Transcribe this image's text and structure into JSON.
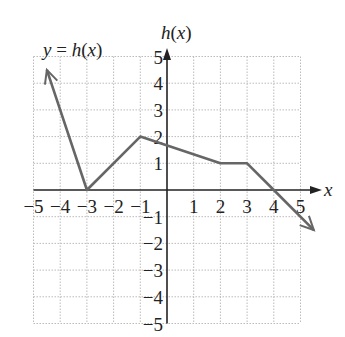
{
  "chart_data": {
    "type": "line",
    "title": "y = h(x)",
    "xlabel": "x",
    "ylabel": "h(x)",
    "xlim": [
      -5,
      5
    ],
    "ylim": [
      -5,
      5
    ],
    "grid": true,
    "x_ticks": [
      -5,
      -4,
      -3,
      -2,
      -1,
      1,
      2,
      3,
      4,
      5
    ],
    "y_ticks": [
      -5,
      -4,
      -3,
      -2,
      -1,
      1,
      2,
      3,
      4,
      5
    ],
    "series": [
      {
        "name": "h(x)",
        "points": [
          [
            -4.5,
            4.5
          ],
          [
            -3,
            0
          ],
          [
            -1,
            2
          ],
          [
            2,
            1
          ],
          [
            3,
            1
          ],
          [
            4,
            0
          ],
          [
            5.5,
            -1.5
          ]
        ],
        "arrow_start": true,
        "arrow_end": true
      }
    ],
    "line_color": "#666666"
  },
  "labels": {
    "title": "y = h(x)",
    "y_axis": "h(x)",
    "x_axis": "x"
  }
}
